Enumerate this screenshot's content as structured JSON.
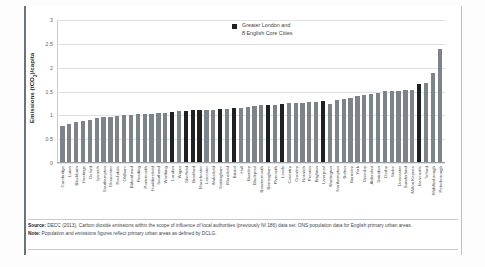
{
  "chart_data": {
    "type": "bar",
    "title": "",
    "xlabel": "",
    "ylabel": "Emissions (tCO2)/capita",
    "ylim": [
      0,
      3
    ],
    "yticks": [
      "0",
      "0.5",
      "1",
      "1.5",
      "2",
      "2.5",
      "3"
    ],
    "grid": true,
    "legend_position": "top-right",
    "legend": [
      {
        "label_line1": "Greater London and",
        "label_line2": "8 English Core Cities",
        "color": "#1d2024"
      }
    ],
    "series_colors": {
      "default": "#7d838a",
      "highlight": "#1d2024"
    },
    "categories": [
      "Cambridge",
      "Luton",
      "Blackburn",
      "Hastings",
      "Oxford",
      "Ipswich",
      "Southampton",
      "Gloucester",
      "Rochdale",
      "Oldham",
      "Birkenhead",
      "Reading",
      "Portsmouth",
      "Huddersfield",
      "Southend",
      "Worthing",
      "London",
      "Wigan",
      "Sheffield",
      "Bradford",
      "Manchester",
      "Leicester",
      "Wakefield",
      "Nottingham",
      "Mansfield",
      "Bristol",
      "Hull",
      "Burnley",
      "Blackpool",
      "Bournemouth",
      "Birmingham",
      "Plymouth",
      "Leeds",
      "Coventry",
      "Crawley",
      "Norwich",
      "Preston",
      "Brighton",
      "Liverpool",
      "Warrington",
      "Northampton",
      "Bolton",
      "Barnsley",
      "York",
      "Grimsby",
      "Aldershot",
      "Swindon",
      "Derby",
      "Stoke",
      "Doncaster",
      "Sunderland",
      "Milton Keynes",
      "Newcastle",
      "Telford",
      "Middlesbrough",
      "Peterborough"
    ],
    "values": [
      0.76,
      0.8,
      0.85,
      0.87,
      0.89,
      0.92,
      0.95,
      0.96,
      0.97,
      0.99,
      1.0,
      1.01,
      1.01,
      1.02,
      1.03,
      1.04,
      1.06,
      1.07,
      1.08,
      1.09,
      1.09,
      1.1,
      1.1,
      1.11,
      1.12,
      1.14,
      1.15,
      1.17,
      1.19,
      1.2,
      1.21,
      1.21,
      1.23,
      1.24,
      1.25,
      1.25,
      1.26,
      1.27,
      1.28,
      1.23,
      1.31,
      1.33,
      1.36,
      1.39,
      1.41,
      1.43,
      1.46,
      1.49,
      1.5,
      1.51,
      1.52,
      1.53,
      1.64,
      1.66,
      1.89,
      2.39
    ],
    "highlighted": [
      "London",
      "Sheffield",
      "Bradford",
      "Manchester",
      "Nottingham",
      "Bristol",
      "Birmingham",
      "Leeds",
      "Liverpool",
      "Newcastle"
    ]
  },
  "legend": {
    "line1": "Greater London and",
    "line2": "8 English Core Cities"
  },
  "axis": {
    "y_title_main": "Emissions (tCO",
    "y_title_sub": "2",
    "y_title_tail": ")/capita"
  },
  "footnote": {
    "source_label": "Source:",
    "source_text": " DECC (2013), Carbon dioxide emissions within the scope of influence of local authorities (previously NI 186) data set; ONS population data for English primary urban areas.",
    "note_label": "Note:",
    "note_text": " Population and emissions figures reflect primary urban areas as defined by DCLG."
  }
}
